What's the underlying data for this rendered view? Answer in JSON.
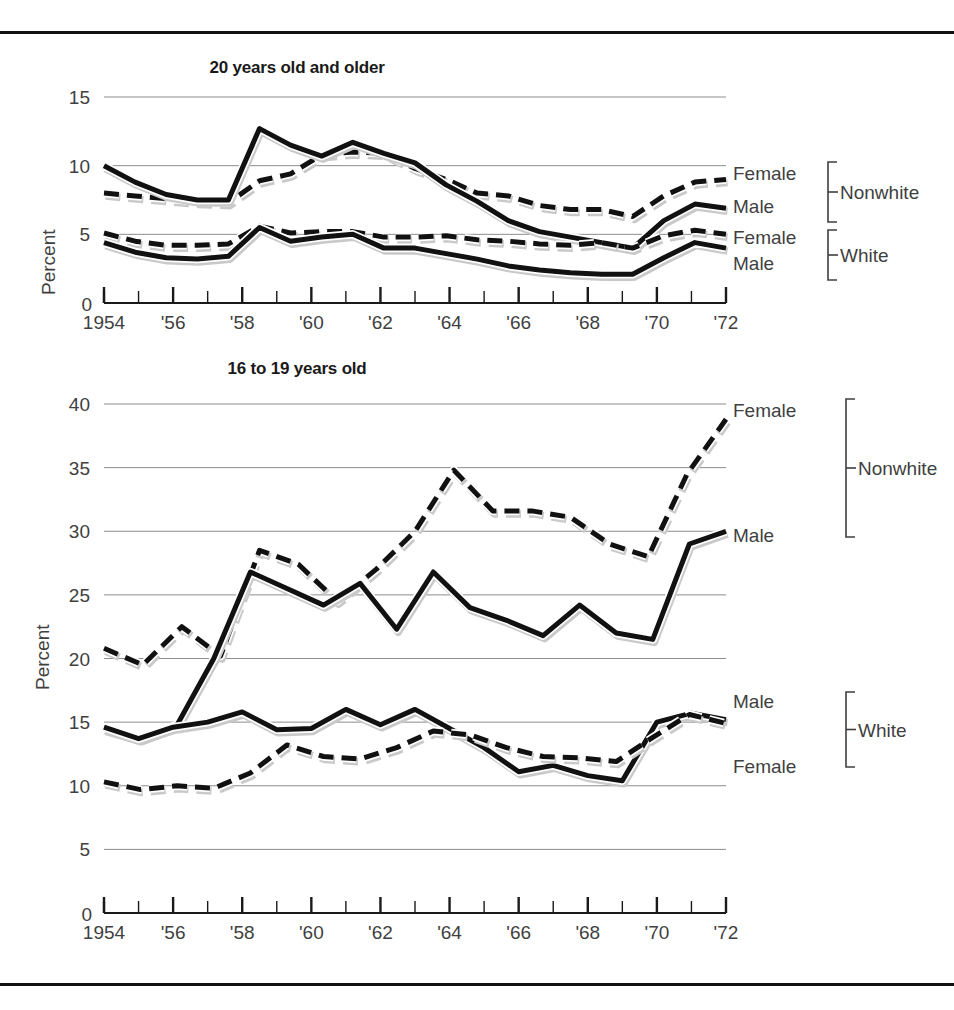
{
  "figure": {
    "rule_color": "#111111",
    "axis_color": "#3f3f3f",
    "grid_color": "#8d8d8d",
    "line_color": "#111111",
    "shadow_color": "#c9c9c9"
  },
  "charts": [
    {
      "id": "top",
      "title": "20 years old and older",
      "ylabel": "Percent",
      "yticks": [
        0,
        5,
        10,
        15
      ],
      "ylim": [
        0,
        15
      ],
      "xlim": [
        1954,
        1972
      ],
      "xticks": [
        1954,
        1955,
        1956,
        1957,
        1958,
        1959,
        1960,
        1961,
        1962,
        1963,
        1964,
        1965,
        1966,
        1967,
        1968,
        1969,
        1970,
        1971,
        1972
      ],
      "xticklabels": [
        "1954",
        "",
        "'56",
        "",
        "'58",
        "",
        "'60",
        "",
        "'62",
        "",
        "'64",
        "",
        "'66",
        "",
        "'68",
        "",
        "'70",
        "",
        "'72"
      ],
      "zero_label": "0",
      "legend": [
        {
          "label": "Female",
          "group": "Nonwhite",
          "style": "dashed"
        },
        {
          "label": "Male",
          "group": "Nonwhite",
          "style": "solid"
        },
        {
          "label": "Female",
          "group": "White",
          "style": "dashed"
        },
        {
          "label": "Male",
          "group": "White",
          "style": "solid"
        }
      ],
      "groups": [
        "Nonwhite",
        "White"
      ]
    },
    {
      "id": "bottom",
      "title": "16 to 19 years old",
      "ylabel": "Percent",
      "yticks": [
        0,
        5,
        10,
        15,
        20,
        25,
        30,
        35,
        40
      ],
      "ylim": [
        0,
        40
      ],
      "xlim": [
        1954,
        1972
      ],
      "xticks": [
        1954,
        1955,
        1956,
        1957,
        1958,
        1959,
        1960,
        1961,
        1962,
        1963,
        1964,
        1965,
        1966,
        1967,
        1968,
        1969,
        1970,
        1971,
        1972
      ],
      "xticklabels": [
        "1954",
        "",
        "'56",
        "",
        "'58",
        "",
        "'60",
        "",
        "'62",
        "",
        "'64",
        "",
        "'66",
        "",
        "'68",
        "",
        "'70",
        "",
        "'72"
      ],
      "zero_label": "0",
      "legend": [
        {
          "label": "Female",
          "group": "Nonwhite",
          "style": "dashed"
        },
        {
          "label": "Male",
          "group": "Nonwhite",
          "style": "solid"
        },
        {
          "label": "Male",
          "group": "White",
          "style": "solid"
        },
        {
          "label": "Female",
          "group": "White",
          "style": "dashed"
        }
      ],
      "groups": [
        "Nonwhite",
        "White"
      ]
    }
  ],
  "chart_data": [
    {
      "type": "line",
      "id": "unemployment-20-and-older",
      "title": "20 years old and older",
      "xlabel": "",
      "ylabel": "Percent",
      "xlim": [
        1954,
        1972
      ],
      "ylim": [
        0,
        15
      ],
      "grid": true,
      "legend_position": "right",
      "x": [
        1954,
        1955,
        1956,
        1957,
        1958,
        1959,
        1960,
        1961,
        1962,
        1963,
        1964,
        1965,
        1966,
        1967,
        1968,
        1969,
        1970,
        1971,
        1972
      ],
      "series": [
        {
          "name": "Nonwhite Female",
          "style": "dashed",
          "values": [
            8.0,
            7.8,
            7.6,
            7.4,
            7.3,
            8.9,
            9.4,
            10.8,
            11.0,
            10.9,
            9.8,
            9.0,
            8.0,
            7.8,
            7.1,
            6.8,
            6.8,
            6.3,
            7.8,
            8.8,
            9.0
          ]
        },
        {
          "name": "Nonwhite Male",
          "style": "solid",
          "values": [
            10.0,
            8.8,
            7.9,
            7.5,
            7.5,
            12.7,
            11.5,
            10.7,
            11.7,
            10.9,
            10.2,
            8.6,
            7.4,
            6.0,
            5.2,
            4.8,
            4.4,
            4.0,
            6.0,
            7.2,
            6.9
          ]
        },
        {
          "name": "White Female",
          "style": "dashed",
          "values": [
            5.1,
            4.5,
            4.2,
            4.2,
            4.3,
            5.6,
            5.1,
            5.2,
            5.2,
            4.8,
            4.8,
            4.9,
            4.6,
            4.5,
            4.3,
            4.2,
            4.4,
            4.0,
            4.9,
            5.3,
            5.0
          ]
        },
        {
          "name": "White Male",
          "style": "solid",
          "values": [
            4.4,
            3.7,
            3.3,
            3.2,
            3.4,
            5.5,
            4.5,
            4.8,
            5.0,
            4.0,
            4.0,
            3.6,
            3.2,
            2.7,
            2.4,
            2.2,
            2.1,
            2.1,
            3.3,
            4.4,
            4.0
          ]
        }
      ]
    },
    {
      "type": "line",
      "id": "unemployment-16-to-19",
      "title": "16 to 19 years old",
      "xlabel": "",
      "ylabel": "Percent",
      "xlim": [
        1954,
        1972
      ],
      "ylim": [
        0,
        40
      ],
      "grid": true,
      "legend_position": "right",
      "x": [
        1954,
        1955,
        1956,
        1957,
        1958,
        1959,
        1960,
        1961,
        1962,
        1963,
        1964,
        1965,
        1966,
        1967,
        1968,
        1969,
        1970,
        1971,
        1972
      ],
      "series": [
        {
          "name": "Nonwhite Female",
          "style": "dashed",
          "values": [
            20.8,
            19.5,
            22.5,
            20.2,
            28.5,
            27.4,
            24.5,
            27.0,
            30.0,
            34.8,
            31.6,
            31.6,
            31.1,
            29.0,
            28.0,
            34.5,
            38.8
          ]
        },
        {
          "name": "Nonwhite Male",
          "style": "solid",
          "values": [
            14.5,
            13.7,
            14.8,
            20.0,
            26.8,
            25.5,
            24.2,
            25.9,
            22.3,
            26.8,
            24.0,
            23.0,
            21.8,
            24.2,
            22.0,
            21.5,
            29.0,
            30.0
          ]
        },
        {
          "name": "White Male",
          "style": "solid",
          "values": [
            14.6,
            13.7,
            14.6,
            15.0,
            15.8,
            14.4,
            14.5,
            16.0,
            14.8,
            16.0,
            14.5,
            13.0,
            11.1,
            11.6,
            10.8,
            10.4,
            15.0,
            15.7,
            15.2
          ]
        },
        {
          "name": "White Female",
          "style": "dashed",
          "values": [
            10.3,
            9.7,
            10.0,
            9.8,
            11.0,
            13.2,
            12.3,
            12.1,
            13.0,
            14.3,
            14.0,
            13.0,
            12.3,
            12.2,
            11.9,
            13.8,
            15.6,
            14.9
          ]
        }
      ]
    }
  ]
}
